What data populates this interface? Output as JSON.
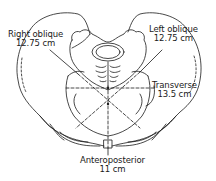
{
  "figure": {
    "line_color": "#1a1a1a",
    "background": "#ffffff"
  },
  "labels": {
    "right_oblique": {
      "name": "Right oblique",
      "value": "12.75 cm"
    },
    "left_oblique": {
      "name": "Left oblique",
      "value": "12.75 cm"
    },
    "transverse": {
      "name": "Transverse",
      "value": "13.5 cm"
    },
    "anteroposterior": {
      "name": "Anteroposterior",
      "value": "11 cm"
    }
  }
}
